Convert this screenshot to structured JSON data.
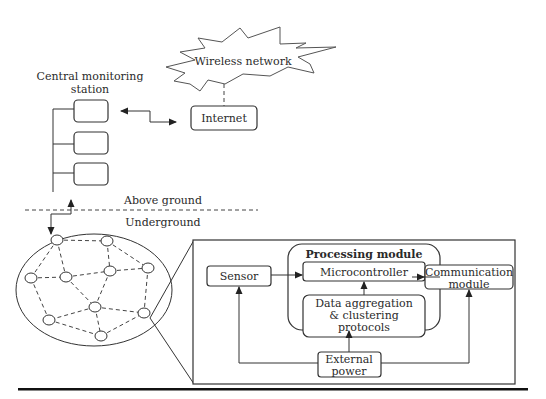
{
  "diagram": {
    "wireless_network": "Wireless network",
    "internet": "Internet",
    "central_station": {
      "line1": "Central monitoring",
      "line2": "station"
    },
    "above_ground": "Above ground",
    "underground": "Underground",
    "processing_module": "Processing module",
    "sensor": "Sensor",
    "microcontroller": "Microcontroller",
    "data_aggregation": {
      "line1": "Data aggregation",
      "line2": "& clustering",
      "line3": "protocols"
    },
    "communication_module": {
      "line1": "Communication",
      "line2": "module"
    },
    "external_power": {
      "line1": "External",
      "line2": "power"
    },
    "network_node_count": 10
  }
}
